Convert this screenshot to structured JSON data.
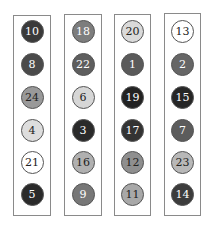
{
  "columns": [
    {
      "x": 13,
      "y": 15,
      "w": 38,
      "h": 201,
      "balls": [
        {
          "label": "10",
          "fill": "#3a3a3a",
          "text": "#ffffff"
        },
        {
          "label": "8",
          "fill": "#4a4a4a",
          "text": "#ffffff"
        },
        {
          "label": "24",
          "fill": "#999999",
          "text": "#222222"
        },
        {
          "label": "4",
          "fill": "#dddddd",
          "text": "#222222"
        },
        {
          "label": "21",
          "fill": "#ffffff",
          "text": "#222222"
        },
        {
          "label": "5",
          "fill": "#2a2a2a",
          "text": "#ffffff"
        }
      ]
    },
    {
      "x": 64,
      "y": 14,
      "w": 38,
      "h": 202,
      "balls": [
        {
          "label": "18",
          "fill": "#7d7d7d",
          "text": "#ffffff"
        },
        {
          "label": "22",
          "fill": "#5e5e5e",
          "text": "#ffffff"
        },
        {
          "label": "6",
          "fill": "#d6d6d6",
          "text": "#222222"
        },
        {
          "label": "3",
          "fill": "#2a2a2a",
          "text": "#ffffff"
        },
        {
          "label": "16",
          "fill": "#b0b0b0",
          "text": "#222222"
        },
        {
          "label": "9",
          "fill": "#777777",
          "text": "#ffffff"
        }
      ]
    },
    {
      "x": 114,
      "y": 14,
      "w": 37,
      "h": 202,
      "balls": [
        {
          "label": "20",
          "fill": "#dadada",
          "text": "#222222"
        },
        {
          "label": "1",
          "fill": "#5a5a5a",
          "text": "#ffffff"
        },
        {
          "label": "19",
          "fill": "#222222",
          "text": "#ffffff"
        },
        {
          "label": "17",
          "fill": "#333333",
          "text": "#ffffff"
        },
        {
          "label": "12",
          "fill": "#8f8f8f",
          "text": "#222222"
        },
        {
          "label": "11",
          "fill": "#a8a8a8",
          "text": "#222222"
        }
      ]
    },
    {
      "x": 164,
      "y": 13,
      "w": 37,
      "h": 203,
      "balls": [
        {
          "label": "13",
          "fill": "#ffffff",
          "text": "#222222"
        },
        {
          "label": "2",
          "fill": "#666666",
          "text": "#ffffff"
        },
        {
          "label": "15",
          "fill": "#262626",
          "text": "#ffffff"
        },
        {
          "label": "7",
          "fill": "#5c5c5c",
          "text": "#ffffff"
        },
        {
          "label": "23",
          "fill": "#b8b8b8",
          "text": "#222222"
        },
        {
          "label": "14",
          "fill": "#3c3c3c",
          "text": "#ffffff"
        }
      ]
    }
  ],
  "row_centers_y": [
    31,
    64,
    97,
    130,
    162,
    194
  ]
}
